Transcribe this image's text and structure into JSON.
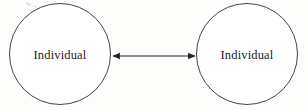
{
  "figure": {
    "type": "relationship-diagram",
    "background_color": "#fdfdfc",
    "stroke_color": "#2a2a2a",
    "text_color": "#1b1b1b",
    "width": 307,
    "height": 110
  },
  "nodes": [
    {
      "id": "left-node",
      "label": "Individual",
      "shape": "circle",
      "cx": 60,
      "cy": 54,
      "r": 50.5
    },
    {
      "id": "right-node",
      "label": "Individual",
      "shape": "circle",
      "cx": 247,
      "cy": 54,
      "r": 50.5
    }
  ],
  "connector": {
    "id": "bidirectional-arrow",
    "style": "double-headed-arrow",
    "label": "",
    "x1": 112,
    "x2": 196,
    "y": 56,
    "arrowhead": "solid-triangle"
  }
}
